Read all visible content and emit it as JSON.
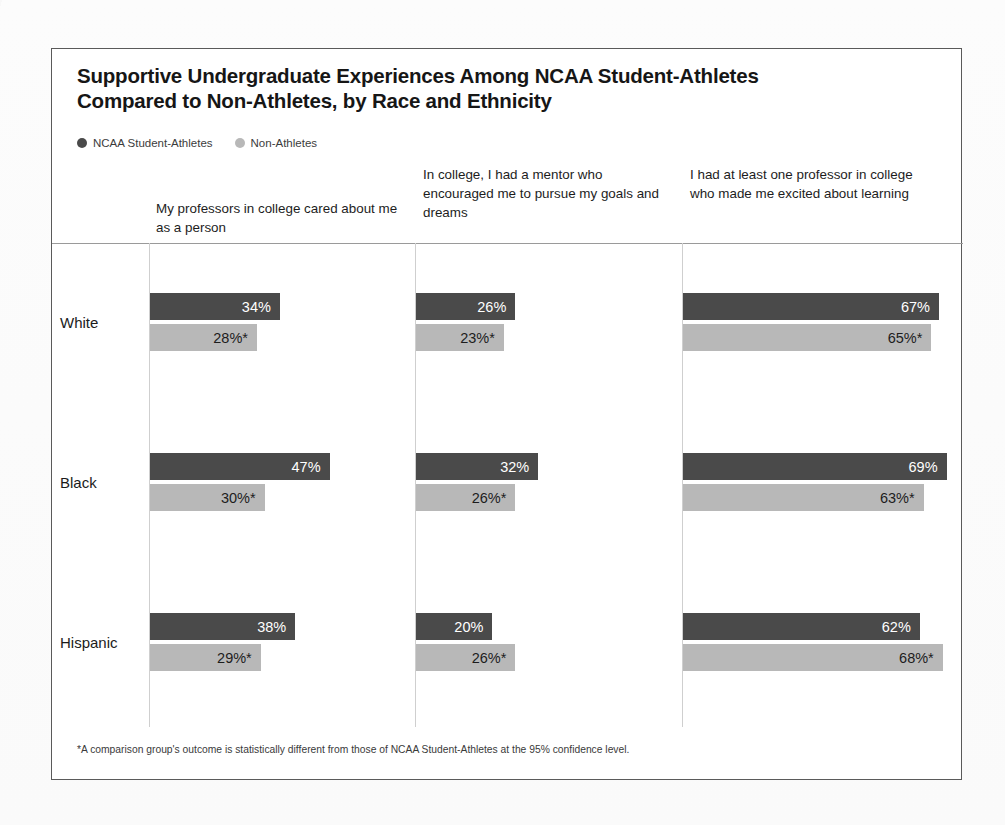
{
  "chart_data": {
    "type": "bar",
    "orientation": "horizontal",
    "title": "Supportive Undergraduate Experiences Among NCAA Student-Athletes Compared to Non-Athletes, by Race and Ethnicity",
    "title_line1": "Supportive Undergraduate Experiences Among NCAA Student-Athletes",
    "title_line2": "Compared to Non-Athletes, by Race and Ethnicity",
    "xlabel": "",
    "ylabel": "",
    "xlim": [
      0,
      70
    ],
    "grid": false,
    "legend_position": "top-left",
    "panels": [
      "My professors in college cared about me as a person",
      "In college, I had a mentor who encouraged me to pursue my goals and dreams",
      "I had at least one professor in college who made me excited about learning"
    ],
    "categories": [
      "White",
      "Black",
      "Hispanic"
    ],
    "series": [
      {
        "name": "NCAA Student-Athletes",
        "color": "#4a4a4a",
        "values_by_panel": [
          [
            34,
            47,
            38
          ],
          [
            26,
            32,
            20
          ],
          [
            67,
            69,
            62
          ]
        ],
        "labels_by_panel": [
          [
            "34%",
            "47%",
            "38%"
          ],
          [
            "26%",
            "32%",
            "20%"
          ],
          [
            "67%",
            "69%",
            "62%"
          ]
        ]
      },
      {
        "name": "Non-Athletes",
        "color": "#b8b8b8",
        "values_by_panel": [
          [
            28,
            30,
            29
          ],
          [
            23,
            26,
            26
          ],
          [
            65,
            63,
            68
          ]
        ],
        "labels_by_panel": [
          [
            "28%*",
            "30%*",
            "29%*"
          ],
          [
            "23%*",
            "26%*",
            "26%*"
          ],
          [
            "65%*",
            "63%*",
            "68%*"
          ]
        ]
      }
    ],
    "footnote": "*A comparison group's outcome is statistically different from those of NCAA Student-Athletes at the 95% confidence level."
  },
  "legend": {
    "items": [
      {
        "label": "NCAA Student-Athletes",
        "color": "#4a4a4a"
      },
      {
        "label": "Non-Athletes",
        "color": "#b8b8b8"
      }
    ]
  },
  "colors": {
    "athlete": "#4a4a4a",
    "nonathlete": "#b8b8b8",
    "border": "#5a5a5a",
    "separator": "#cfcfcf",
    "rule": "#9a9a9a"
  }
}
